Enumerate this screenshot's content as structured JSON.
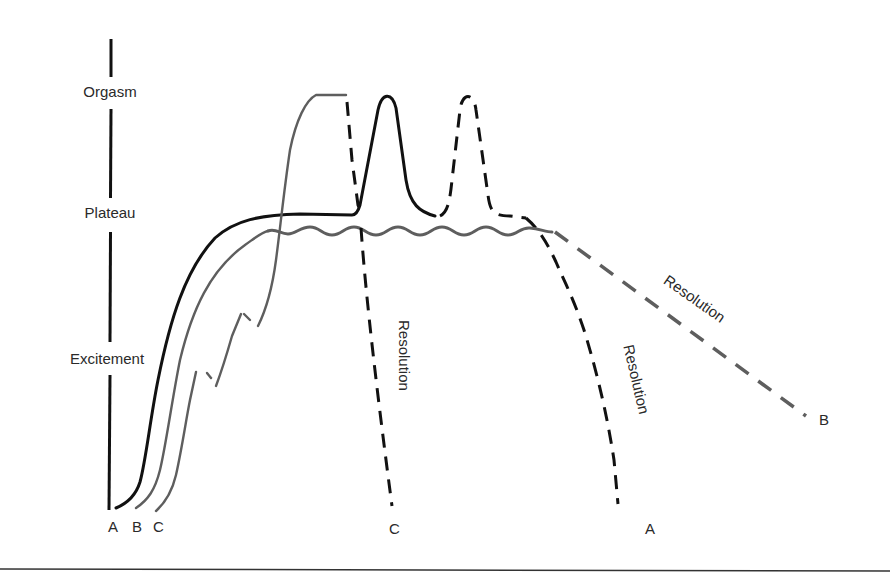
{
  "diagram": {
    "type": "sexual-response-cycle",
    "phases": {
      "orgasm": "Orgasm",
      "plateau": "Plateau",
      "excitement": "Excitement"
    },
    "start_labels": {
      "a": "A",
      "b": "B",
      "c": "C"
    },
    "end_labels": {
      "c": "C",
      "a": "A",
      "b": "B"
    },
    "resolution_labels": {
      "c": "Resolution",
      "a": "Resolution",
      "b": "Resolution"
    },
    "curves": [
      {
        "id": "A",
        "description": "Excitement rising to plateau, two orgasm peaks (second dashed), then resolution",
        "color": "#111111"
      },
      {
        "id": "B",
        "description": "Excitement to wavy plateau, no orgasm, slow resolution",
        "color": "#5e5e5e"
      },
      {
        "id": "C",
        "description": "Stepped excitement, brief plateau, prolonged orgasm, rapid resolution",
        "color": "#5e5e5e"
      }
    ]
  }
}
